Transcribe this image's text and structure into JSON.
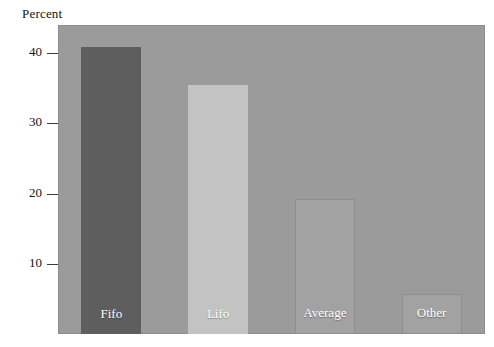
{
  "chart_data": {
    "type": "bar",
    "title": "",
    "subtitle": "",
    "xlabel": "",
    "ylabel": "Percent",
    "categories": [
      "Fifo",
      "Lifo",
      "Average",
      "Other"
    ],
    "values": [
      40.8,
      35.4,
      19.2,
      5.7
    ],
    "series": [
      {
        "name": "Percent",
        "values": [
          40.8,
          35.4,
          19.2,
          5.7
        ]
      }
    ],
    "bar_colors": [
      "#5e5e5e",
      "#c3c3c3",
      "#a2a2a2",
      "#a2a2a2"
    ],
    "bar_label_color": "#ffffff",
    "plot_background": "#9b9b9b",
    "page_background": "#ffffff",
    "ylim": [
      0,
      44.0
    ],
    "yticks": [
      10,
      20,
      30,
      40
    ],
    "ytick_labels": [
      "10",
      "20",
      "30",
      "40"
    ],
    "grid": false,
    "legend": false,
    "legend_position": "none"
  },
  "axis": {
    "y_title": "Percent"
  }
}
